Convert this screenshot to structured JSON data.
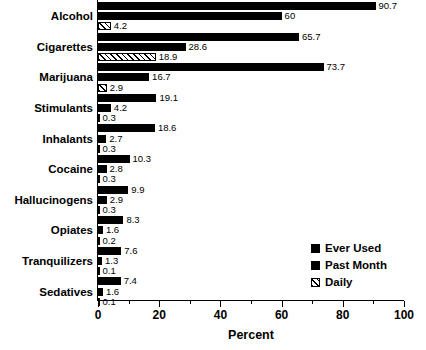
{
  "chart_data": {
    "type": "bar",
    "orientation": "horizontal",
    "title": "",
    "xlabel": "Percent",
    "ylabel": "",
    "xlim": [
      0,
      100
    ],
    "xticks": [
      0,
      20,
      40,
      60,
      80,
      100
    ],
    "xtick_labels": [
      "0",
      "20",
      "40",
      "60",
      "80",
      "100"
    ],
    "minor_tick_step": 10,
    "grid": false,
    "legend_position": "center-right",
    "categories": [
      "Alcohol",
      "Cigarettes",
      "Marijuana",
      "Stimulants",
      "Inhalants",
      "Cocaine",
      "Hallucinogens",
      "Opiates",
      "Tranquilizers",
      "Sedatives"
    ],
    "series": [
      {
        "name": "Ever Used",
        "fill": "solid",
        "color": "#000000",
        "values": [
          90.7,
          65.7,
          73.7,
          19.1,
          18.6,
          10.3,
          9.9,
          8.3,
          7.6,
          7.4
        ],
        "labels": [
          "90.7",
          "65.7",
          "73.7",
          "19.1",
          "18.6",
          "10.3",
          "9.9",
          "8.3",
          "7.6",
          "7.4"
        ]
      },
      {
        "name": "Past Month",
        "fill": "solid",
        "color": "#000000",
        "values": [
          60,
          28.6,
          16.7,
          4.2,
          2.7,
          2.8,
          2.9,
          1.6,
          1.3,
          1.6
        ],
        "labels": [
          "60",
          "28.6",
          "16.7",
          "4.2",
          "2.7",
          "2.8",
          "2.9",
          "1.6",
          "1.3",
          "1.6"
        ]
      },
      {
        "name": "Daily",
        "fill": "hatch",
        "color": "#000000",
        "values": [
          4.2,
          18.9,
          2.9,
          0.3,
          0.3,
          0.3,
          0.3,
          0.2,
          0.1,
          0.1
        ],
        "labels": [
          "4.2",
          "18.9",
          "2.9",
          "0.3",
          "0.3",
          "0.3",
          "0.3",
          "0.2",
          "0.1",
          "0.1"
        ]
      }
    ]
  },
  "legend": {
    "items": [
      {
        "label": "Ever Used",
        "fill": "solid"
      },
      {
        "label": "Past Month",
        "fill": "solid"
      },
      {
        "label": "Daily",
        "fill": "hatch"
      }
    ]
  },
  "axis": {
    "x_title": "Percent"
  }
}
